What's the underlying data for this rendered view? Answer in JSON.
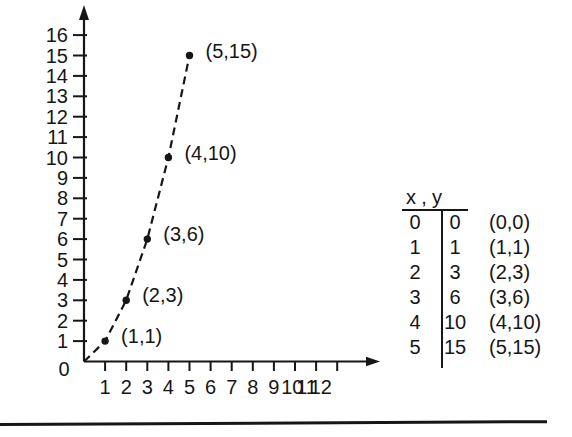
{
  "chart_data": {
    "type": "scatter",
    "title": "",
    "xlabel": "",
    "ylabel": "",
    "line_style": "dashed",
    "grid": false,
    "xlim": [
      0,
      13
    ],
    "ylim": [
      0,
      17
    ],
    "x_ticks": [
      1,
      2,
      3,
      4,
      5,
      6,
      7,
      8,
      9,
      10,
      11,
      12
    ],
    "y_ticks": [
      1,
      2,
      3,
      4,
      5,
      6,
      7,
      8,
      9,
      10,
      11,
      12,
      13,
      14,
      15,
      16
    ],
    "origin_label": "0",
    "points": [
      {
        "x": 0,
        "y": 0,
        "label": ""
      },
      {
        "x": 1,
        "y": 1,
        "label": "(1,1)"
      },
      {
        "x": 2,
        "y": 3,
        "label": "(2,3)"
      },
      {
        "x": 3,
        "y": 6,
        "label": "(3,6)"
      },
      {
        "x": 4,
        "y": 10,
        "label": "(4,10)"
      },
      {
        "x": 5,
        "y": 15,
        "label": "(5,15)"
      }
    ]
  },
  "table": {
    "header": {
      "x": "x",
      "comma": ",",
      "y": "y"
    },
    "rows": [
      {
        "x": "0",
        "y": "0",
        "pair": "(0,0)"
      },
      {
        "x": "1",
        "y": "1",
        "pair": "(1,1)"
      },
      {
        "x": "2",
        "y": "3",
        "pair": "(2,3)"
      },
      {
        "x": "3",
        "y": "6",
        "pair": "(3,6)"
      },
      {
        "x": "4",
        "y": "10",
        "pair": "(4,10)"
      },
      {
        "x": "5",
        "y": "15",
        "pair": "(5,15)"
      }
    ]
  },
  "colors": {
    "ink": "#161616",
    "background": "#ffffff"
  }
}
